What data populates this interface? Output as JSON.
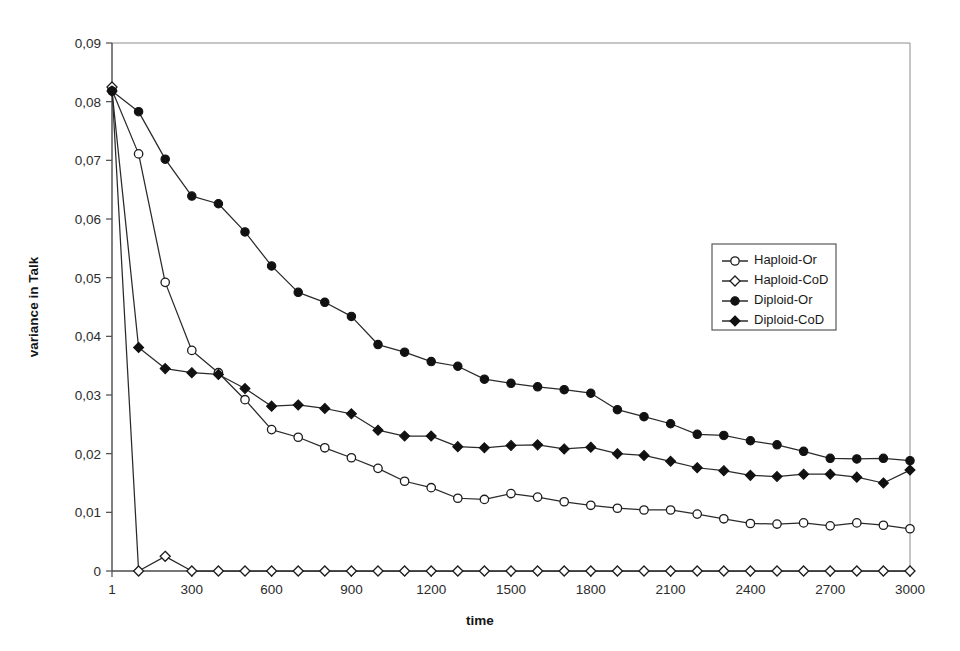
{
  "chart_data": {
    "type": "line",
    "title": "",
    "xlabel": "time",
    "ylabel": "variance in Talk",
    "grid": false,
    "legend_position": "inside-upper-right",
    "decimal_separator": ",",
    "xlim": [
      1,
      3000
    ],
    "ylim": [
      0,
      0.09
    ],
    "x_tick_labels": [
      "1",
      "300",
      "600",
      "900",
      "1200",
      "1500",
      "1800",
      "2100",
      "2400",
      "2700",
      "3000"
    ],
    "x_tick_values": [
      1,
      300,
      600,
      900,
      1200,
      1500,
      1800,
      2100,
      2400,
      2700,
      3000
    ],
    "y_tick_labels": [
      "0",
      "0,01",
      "0,02",
      "0,03",
      "0,04",
      "0,05",
      "0,06",
      "0,07",
      "0,08",
      "0,09"
    ],
    "y_tick_values": [
      0,
      0.01,
      0.02,
      0.03,
      0.04,
      0.05,
      0.06,
      0.07,
      0.08,
      0.09
    ],
    "x": [
      1,
      100,
      200,
      300,
      400,
      500,
      600,
      700,
      800,
      900,
      1000,
      1100,
      1200,
      1300,
      1400,
      1500,
      1600,
      1700,
      1800,
      1900,
      2000,
      2100,
      2200,
      2300,
      2400,
      2500,
      2600,
      2700,
      2800,
      2900,
      3000
    ],
    "series": [
      {
        "name": "Haploid-Or",
        "marker": "open-circle",
        "values": [
          0.082,
          0.0711,
          0.0492,
          0.0376,
          0.0338,
          0.0292,
          0.0241,
          0.0228,
          0.021,
          0.0193,
          0.0175,
          0.0153,
          0.0142,
          0.0124,
          0.0122,
          0.0132,
          0.0126,
          0.0118,
          0.0112,
          0.0107,
          0.0104,
          0.0104,
          0.0097,
          0.0089,
          0.0081,
          0.008,
          0.0082,
          0.0077,
          0.0082,
          0.0078,
          0.0072
        ]
      },
      {
        "name": "Haploid-CoD",
        "marker": "open-diamond",
        "values": [
          0.0825,
          0.0,
          0.0025,
          0.0,
          0.0,
          0.0,
          0.0,
          0.0,
          0.0,
          0.0,
          0.0,
          0.0,
          0.0,
          0.0,
          0.0,
          0.0,
          0.0,
          0.0,
          0.0,
          0.0,
          0.0,
          0.0,
          0.0,
          0.0,
          0.0,
          0.0,
          0.0,
          0.0,
          0.0,
          0.0,
          0.0
        ]
      },
      {
        "name": "Diploid-Or",
        "marker": "filled-circle",
        "values": [
          0.0818,
          0.0783,
          0.0702,
          0.0639,
          0.0626,
          0.0578,
          0.052,
          0.0475,
          0.0458,
          0.0434,
          0.0386,
          0.0373,
          0.0357,
          0.0349,
          0.0327,
          0.032,
          0.0314,
          0.0309,
          0.0303,
          0.0275,
          0.0263,
          0.0251,
          0.0233,
          0.0231,
          0.0222,
          0.0215,
          0.0204,
          0.0192,
          0.0191,
          0.0192,
          0.0188
        ]
      },
      {
        "name": "Diploid-CoD",
        "marker": "filled-diamond",
        "values": [
          0.0818,
          0.0381,
          0.0345,
          0.0338,
          0.0335,
          0.0311,
          0.0281,
          0.0283,
          0.0277,
          0.0268,
          0.024,
          0.023,
          0.023,
          0.0212,
          0.021,
          0.0214,
          0.0215,
          0.0208,
          0.0211,
          0.02,
          0.0197,
          0.0187,
          0.0176,
          0.0171,
          0.0163,
          0.0161,
          0.0165,
          0.0165,
          0.016,
          0.015,
          0.0172
        ]
      }
    ]
  }
}
